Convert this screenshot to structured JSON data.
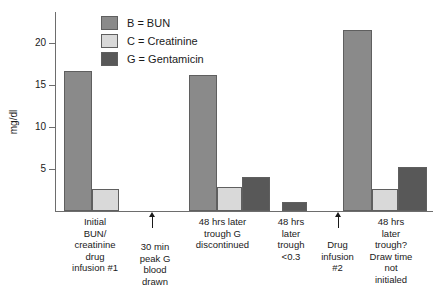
{
  "chart_data": {
    "type": "bar",
    "title": "",
    "subtitle": "",
    "xlabel": "",
    "ylabel": "mg/dl",
    "ylim": [
      0,
      22
    ],
    "yticks": [
      5,
      10,
      15,
      20
    ],
    "ytick_labels": [
      "5",
      "10",
      "15",
      "20"
    ],
    "grid": false,
    "legend_position": "top-left-inside",
    "categories": [
      "Initial BUN/ creatinine drug infusion #1",
      "30 min peak G blood drawn",
      "48 hrs later trough G discontinued",
      "48 hrs later trough <0.3",
      "Drug infusion #2",
      "48 hrs later trough? Draw time not initialed"
    ],
    "series": [
      {
        "name": "B = BUN",
        "key": "B",
        "color": "#8a8a8a",
        "values": [
          15.5,
          null,
          15.0,
          null,
          null,
          20.0
        ]
      },
      {
        "name": "C = Creatinine",
        "key": "C",
        "color": "#d9d9d9",
        "values": [
          2.4,
          null,
          2.7,
          null,
          null,
          2.5
        ]
      },
      {
        "name": "G = Gentamicin",
        "key": "G",
        "color": "#585858",
        "values": [
          null,
          null,
          3.8,
          1.0,
          null,
          4.9
        ]
      }
    ],
    "annotations": [
      {
        "name": "arrow-30-min-peak",
        "category_index": 1,
        "glyph": "up-arrow"
      },
      {
        "name": "arrow-drug-infusion-2",
        "category_index": 4,
        "glyph": "up-arrow"
      }
    ]
  },
  "legend": {
    "items": [
      {
        "label": "B = BUN",
        "color": "#8a8a8a"
      },
      {
        "label": "C = Creatinine",
        "color": "#d9d9d9"
      },
      {
        "label": "G = Gentamicin",
        "color": "#585858"
      }
    ]
  },
  "axis": {
    "y_title": "mg/dl",
    "y_tick_labels": [
      "20",
      "15",
      "10",
      "5"
    ]
  },
  "x_labels": [
    {
      "lines": [
        "Initial",
        "BUN/",
        "creatinine",
        "drug",
        "infusion #1"
      ]
    },
    {
      "lines": [
        "30 min",
        "peak G",
        "blood",
        "drawn"
      ]
    },
    {
      "lines": [
        "48 hrs later",
        "trough G",
        "discontinued"
      ]
    },
    {
      "lines": [
        "48 hrs",
        "later",
        "trough",
        "<0.3"
      ]
    },
    {
      "lines": [
        "Drug",
        "infusion",
        "#2"
      ]
    },
    {
      "lines": [
        "48 hrs",
        "later",
        "trough?",
        "Draw time",
        "not",
        "initialed"
      ]
    }
  ],
  "x_labels_text": {
    "g1": "Initial\nBUN/\ncreatinine\ndrug\ninfusion #1",
    "g2": "30 min\npeak G\nblood\ndrawn",
    "g3": "48 hrs later\ntrough G\ndiscontinued",
    "g4": "48 hrs\nlater\ntrough\n<0.3",
    "g5": "Drug\ninfusion\n#2",
    "g6": "48 hrs\nlater\ntrough?\nDraw time\nnot\ninitialed"
  }
}
